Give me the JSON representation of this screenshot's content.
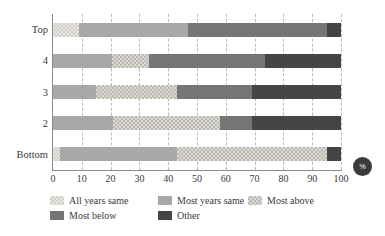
{
  "chart_data": {
    "type": "bar",
    "subtype": "horizontal-stacked-100",
    "title": "",
    "xlabel": "%",
    "ylabel": "",
    "xlim": [
      0,
      100
    ],
    "grid": true,
    "legend_position": "bottom-left",
    "categories": [
      "Top",
      "4",
      "3",
      "2",
      "Bottom"
    ],
    "xticks": [
      0,
      10,
      20,
      30,
      40,
      50,
      60,
      70,
      80,
      90,
      100
    ],
    "series": [
      {
        "name": "All years same",
        "key": "all-years-same",
        "values": [
          9,
          0,
          0,
          0,
          2.5
        ]
      },
      {
        "name": "Most years same",
        "key": "most-years-same",
        "values": [
          38,
          20.5,
          15,
          21,
          40.5
        ]
      },
      {
        "name": "Most above",
        "key": "most-above",
        "values": [
          0,
          13,
          28,
          37,
          52
        ]
      },
      {
        "name": "Most below",
        "key": "most-below",
        "values": [
          48,
          40,
          26,
          11,
          0
        ]
      },
      {
        "name": "Other",
        "key": "other",
        "values": [
          5,
          26.5,
          31,
          31,
          5
        ]
      }
    ],
    "colors": {
      "all-years-same": "#e8e6e2",
      "most-years-same": "#a8a8a8",
      "most-above": "#dcdad5",
      "most-below": "#757575",
      "other": "#454545",
      "axis": "#8c8c8c",
      "gridline": "#b9b9b9",
      "text": "#3a3a3a",
      "badge": "#3b3b3b"
    }
  },
  "axis_badge": {
    "label": "%"
  }
}
